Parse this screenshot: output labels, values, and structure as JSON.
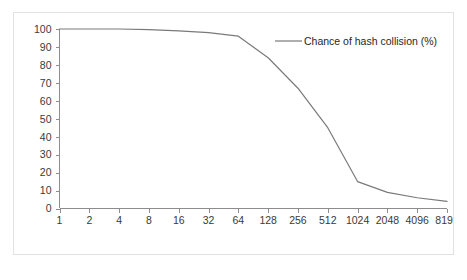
{
  "chart_data": {
    "type": "line",
    "title": "",
    "xlabel": "",
    "ylabel": "",
    "categories": [
      "1",
      "2",
      "4",
      "8",
      "16",
      "32",
      "64",
      "128",
      "256",
      "512",
      "1024",
      "2048",
      "4096",
      "8192"
    ],
    "series": [
      {
        "name": "Chance of hash collision (%)",
        "color": "#7a7a7a",
        "values": [
          100,
          100,
          100,
          99.7,
          99,
          98,
          96,
          84,
          67,
          45,
          15,
          9,
          6,
          4
        ]
      }
    ],
    "ylim": [
      0,
      100
    ],
    "yticks": [
      0,
      10,
      20,
      30,
      40,
      50,
      60,
      70,
      80,
      90,
      100
    ],
    "grid": false,
    "legend": {
      "position": "top-right-inside",
      "entries": [
        "Chance of hash collision (%)"
      ]
    }
  },
  "legend": {
    "label": "Chance of hash collision (%)"
  }
}
